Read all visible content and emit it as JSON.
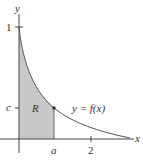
{
  "diagram": {
    "axes": {
      "x_label": "x",
      "y_label": "y"
    },
    "ticks": {
      "y_one": "1",
      "y_c": "c",
      "x_a": "a",
      "x_two": "2"
    },
    "region_label": "R",
    "curve_label": "y = f(x)",
    "colors": {
      "region_fill": "#c8c8c8",
      "curve": "#555555",
      "axis": "#444444"
    }
  }
}
